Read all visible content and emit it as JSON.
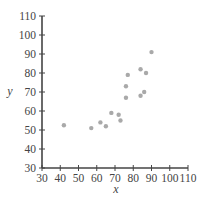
{
  "chart_data": {
    "type": "scatter",
    "title": "",
    "xlabel": "x",
    "ylabel": "y",
    "xlim": [
      30,
      110
    ],
    "ylim": [
      30,
      110
    ],
    "x_ticks": [
      30,
      40,
      50,
      60,
      70,
      80,
      90,
      100,
      110
    ],
    "y_ticks": [
      30,
      40,
      50,
      60,
      70,
      80,
      90,
      100,
      110
    ],
    "x_tick_labels": [
      "30",
      "40",
      "50",
      "60",
      "70",
      "80",
      "90",
      "100",
      "110"
    ],
    "y_tick_labels": [
      "30",
      "40",
      "50",
      "60",
      "70",
      "80",
      "90",
      "100",
      "110"
    ],
    "grid": false,
    "legend": null,
    "series": [
      {
        "name": "data",
        "points": [
          {
            "x": 42,
            "y": 52.5
          },
          {
            "x": 57,
            "y": 51
          },
          {
            "x": 62,
            "y": 54
          },
          {
            "x": 65,
            "y": 52
          },
          {
            "x": 68,
            "y": 59
          },
          {
            "x": 72,
            "y": 58
          },
          {
            "x": 73,
            "y": 55
          },
          {
            "x": 76,
            "y": 73
          },
          {
            "x": 76,
            "y": 67
          },
          {
            "x": 77,
            "y": 79
          },
          {
            "x": 84,
            "y": 82
          },
          {
            "x": 84,
            "y": 68
          },
          {
            "x": 86,
            "y": 70
          },
          {
            "x": 87,
            "y": 80
          },
          {
            "x": 90,
            "y": 91
          }
        ]
      }
    ],
    "colors": {
      "points": "#a9a9a9",
      "axes": "#444444",
      "text": "#444444"
    }
  }
}
